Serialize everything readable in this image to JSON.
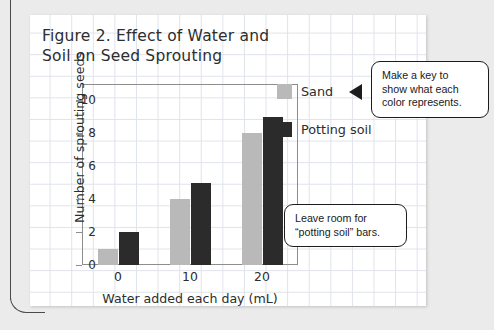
{
  "figure": {
    "title_line1": "Figure 2. Effect of Water and",
    "title_line2": "Soil on Seed Sprouting"
  },
  "chart_data": {
    "type": "bar",
    "title": "Figure 2. Effect of Water and Soil on Seed Sprouting",
    "xlabel": "Water added each day (mL)",
    "ylabel": "Number of sprouting seeds",
    "categories": [
      "0",
      "10",
      "20"
    ],
    "series": [
      {
        "name": "Sand",
        "color": "#b9b9b9",
        "values": [
          1,
          4,
          8
        ]
      },
      {
        "name": "Potting soil",
        "color": "#2b2b2b",
        "values": [
          2,
          5,
          9
        ]
      }
    ],
    "ylim": [
      0,
      11
    ],
    "yticks": [
      "0",
      "2",
      "4",
      "6",
      "8",
      "10"
    ],
    "ytick_values": [
      0,
      2,
      4,
      6,
      8,
      10
    ],
    "grid": false,
    "legend_position": "right"
  },
  "legend": {
    "items": [
      {
        "label": "Sand",
        "color": "#b9b9b9"
      },
      {
        "label": "Potting soil",
        "color": "#2b2b2b"
      }
    ]
  },
  "callouts": {
    "key_note": {
      "line1": "Make a key to",
      "line2": "show what each",
      "line3": "color represents."
    },
    "room_note": {
      "line1": "Leave room for",
      "line2": "“potting soil” bars."
    }
  }
}
